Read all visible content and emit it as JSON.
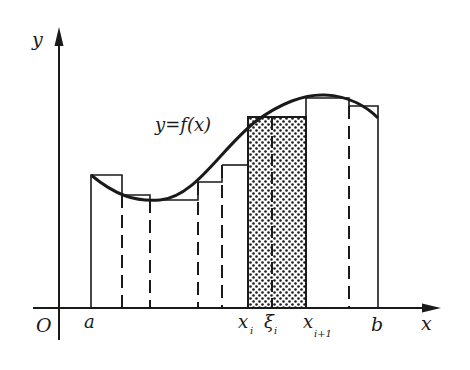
{
  "diagram": {
    "axes": {
      "x_label": "x",
      "y_label": "y",
      "origin_label": "O"
    },
    "curve_label": "y=f(x)",
    "tick_labels": {
      "a": "a",
      "b": "b",
      "x_i": "x",
      "x_i_sub": "i",
      "xi_i": "ξ",
      "xi_i_sub": "i",
      "x_i1": "x",
      "x_i1_sub": "i+1"
    },
    "partition_x": [
      91,
      122,
      150,
      198,
      222,
      248,
      306,
      349,
      378
    ],
    "rect_tops": [
      175,
      195,
      200,
      182,
      165,
      118,
      98,
      106
    ],
    "highlighted_interval": {
      "from": "x_i",
      "to": "x_i+1",
      "sample_point": "ξ_i",
      "fill": "dotted"
    },
    "colors": {
      "ink": "#1a1a1a",
      "background": "#ffffff"
    }
  }
}
